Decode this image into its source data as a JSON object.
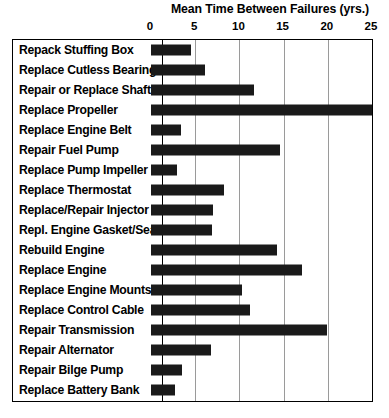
{
  "chart_data": {
    "type": "bar",
    "orientation": "horizontal",
    "title": "Mean Time Between Failures (yrs.)",
    "xlabel": "",
    "ylabel": "",
    "xlim": [
      0,
      25
    ],
    "xticks": [
      0,
      5,
      10,
      15,
      20,
      25
    ],
    "xtick_labels": [
      "0",
      "5",
      "10",
      "15",
      "20",
      "25"
    ],
    "grid": true,
    "grid_axis": "x",
    "legend": false,
    "bar_color": "#1a1a1a",
    "frame_color": "#000000",
    "gridline_color": "#9a9a9a",
    "background": "#ffffff",
    "categories": [
      "Repack Stuffing Box",
      "Replace Cutless Bearing",
      "Repair or Replace Shaft",
      "Replace Propeller",
      "Replace Engine Belt",
      "Repair Fuel Pump",
      "Replace Pump Impeller",
      "Replace Thermostat",
      "Replace/Repair Injector",
      "Repl. Engine Gasket/Seal",
      "Rebuild Engine",
      "Replace Engine",
      "Replace Engine Mounts",
      "Replace Control Cable",
      "Repair Transmission",
      "Repair Alternator",
      "Repair Bilge Pump",
      "Replace Battery Bank"
    ],
    "values": [
      4.5,
      6.1,
      11.6,
      25.0,
      3.4,
      14.6,
      2.9,
      8.3,
      7.0,
      6.9,
      14.3,
      17.1,
      10.3,
      11.2,
      19.9,
      6.8,
      3.5,
      2.7
    ]
  }
}
